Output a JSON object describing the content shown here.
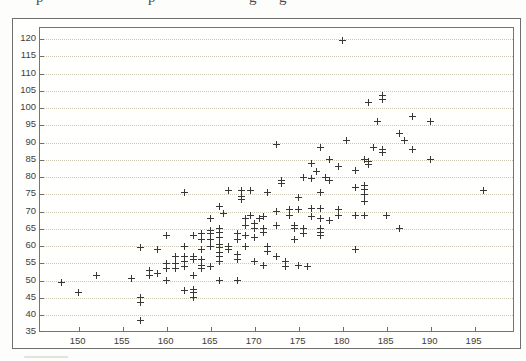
{
  "page": {
    "clipped_text_fragments": [
      "p",
      "p",
      "g",
      "g"
    ]
  },
  "colors": {
    "page_bg": "#fdfdfb",
    "box_border": "#6e6e6e",
    "plot_border": "#757575",
    "grid": "#ccc7b5",
    "tick": "#6e6e6e",
    "label": "#3d3d3d",
    "marker": "#383838"
  },
  "chart_data": {
    "type": "scatter",
    "marker_glyph": "+",
    "title": "",
    "xlabel": "",
    "ylabel": "",
    "legend": "none",
    "grid": "horizontal-dotted",
    "x_ticks": [
      150,
      155,
      160,
      165,
      170,
      175,
      180,
      185,
      190,
      195
    ],
    "y_ticks": [
      35,
      40,
      45,
      50,
      55,
      60,
      65,
      70,
      75,
      80,
      85,
      90,
      95,
      100,
      105,
      110,
      115,
      120
    ],
    "xlim": [
      145.6,
      199.6
    ],
    "ylim": [
      34.8,
      123.2
    ],
    "points": [
      [
        148,
        49.5
      ],
      [
        150,
        46.5
      ],
      [
        152,
        51.5
      ],
      [
        156,
        50.5
      ],
      [
        157,
        59.5
      ],
      [
        157,
        45
      ],
      [
        157,
        43.5
      ],
      [
        157,
        38.5
      ],
      [
        158,
        53
      ],
      [
        158,
        51.5
      ],
      [
        159,
        59
      ],
      [
        159,
        52
      ],
      [
        160,
        63
      ],
      [
        160,
        55
      ],
      [
        160,
        53.5
      ],
      [
        160,
        50
      ],
      [
        161,
        57
      ],
      [
        161,
        55
      ],
      [
        161,
        53.5
      ],
      [
        162,
        75.5
      ],
      [
        162,
        60
      ],
      [
        162,
        57
      ],
      [
        162,
        55.5
      ],
      [
        162,
        54
      ],
      [
        162,
        47
      ],
      [
        163,
        63
      ],
      [
        163,
        57
      ],
      [
        163,
        56
      ],
      [
        163,
        51.5
      ],
      [
        163,
        47.5
      ],
      [
        163,
        46.5
      ],
      [
        163,
        45
      ],
      [
        164,
        63.5
      ],
      [
        164,
        62
      ],
      [
        164,
        59
      ],
      [
        164,
        56
      ],
      [
        164,
        54.5
      ],
      [
        164,
        53.5
      ],
      [
        165,
        68
      ],
      [
        165,
        64.5
      ],
      [
        165,
        63.5
      ],
      [
        165,
        62
      ],
      [
        165,
        60
      ],
      [
        165,
        54
      ],
      [
        166,
        71.5
      ],
      [
        166,
        65
      ],
      [
        166,
        64
      ],
      [
        166,
        62.5
      ],
      [
        166,
        60.5
      ],
      [
        166,
        59.5
      ],
      [
        166,
        58
      ],
      [
        166,
        57
      ],
      [
        166,
        55.5
      ],
      [
        166,
        50
      ],
      [
        166.5,
        69.5
      ],
      [
        167,
        76
      ],
      [
        167,
        60
      ],
      [
        167,
        59
      ],
      [
        168,
        63.5
      ],
      [
        168,
        62
      ],
      [
        168,
        57.5
      ],
      [
        168,
        56
      ],
      [
        168,
        50
      ],
      [
        168.5,
        76
      ],
      [
        168.5,
        74.5
      ],
      [
        168.5,
        73.5
      ],
      [
        169,
        68
      ],
      [
        169,
        66
      ],
      [
        169,
        63
      ],
      [
        169,
        60
      ],
      [
        169.5,
        76
      ],
      [
        169.5,
        69
      ],
      [
        170,
        66.5
      ],
      [
        170,
        65
      ],
      [
        170,
        62.5
      ],
      [
        170,
        55.5
      ],
      [
        170.5,
        68
      ],
      [
        171,
        68.5
      ],
      [
        171,
        65
      ],
      [
        171,
        64
      ],
      [
        171,
        54.5
      ],
      [
        171.5,
        75.5
      ],
      [
        171.5,
        60
      ],
      [
        171.5,
        58.5
      ],
      [
        172.5,
        89.5
      ],
      [
        172.5,
        70
      ],
      [
        172.5,
        66
      ],
      [
        172.5,
        57
      ],
      [
        173,
        79
      ],
      [
        173,
        78
      ],
      [
        174,
        70.5
      ],
      [
        174,
        69
      ],
      [
        173.5,
        55.5
      ],
      [
        173.5,
        54
      ],
      [
        175,
        74
      ],
      [
        175,
        70.5
      ],
      [
        174.5,
        66
      ],
      [
        174.5,
        65
      ],
      [
        174.5,
        62
      ],
      [
        175,
        54.5
      ],
      [
        175.5,
        80
      ],
      [
        175.5,
        65
      ],
      [
        175.5,
        63.5
      ],
      [
        176,
        54
      ],
      [
        176.5,
        84
      ],
      [
        176.5,
        79.5
      ],
      [
        176.5,
        71
      ],
      [
        176.5,
        68.5
      ],
      [
        177.5,
        88.5
      ],
      [
        177,
        81.5
      ],
      [
        177.5,
        75.5
      ],
      [
        177.5,
        71
      ],
      [
        177.5,
        68
      ],
      [
        177.5,
        65
      ],
      [
        177.5,
        64
      ],
      [
        177.5,
        63
      ],
      [
        178.5,
        85
      ],
      [
        178,
        80
      ],
      [
        178.5,
        79
      ],
      [
        178.5,
        67.5
      ],
      [
        179.5,
        83
      ],
      [
        179.5,
        70.5
      ],
      [
        179.5,
        69
      ],
      [
        180,
        119.5
      ],
      [
        180.5,
        90.5
      ],
      [
        181.5,
        82
      ],
      [
        181.5,
        77
      ],
      [
        181.5,
        69
      ],
      [
        181.5,
        59
      ],
      [
        183,
        101.5
      ],
      [
        182.5,
        85
      ],
      [
        182.5,
        77.5
      ],
      [
        182.5,
        76.5
      ],
      [
        182.5,
        75
      ],
      [
        182.5,
        73
      ],
      [
        182.5,
        69
      ],
      [
        184,
        96
      ],
      [
        183.5,
        88.5
      ],
      [
        183,
        84.5
      ],
      [
        183,
        83.5
      ],
      [
        184.5,
        103.5
      ],
      [
        184.5,
        102.5
      ],
      [
        184.5,
        88
      ],
      [
        184.5,
        87
      ],
      [
        185,
        69
      ],
      [
        186.5,
        92.5
      ],
      [
        186.5,
        65
      ],
      [
        187,
        90.5
      ],
      [
        188,
        97.5
      ],
      [
        188,
        88
      ],
      [
        190,
        96
      ],
      [
        190,
        85
      ],
      [
        196,
        76
      ]
    ]
  }
}
